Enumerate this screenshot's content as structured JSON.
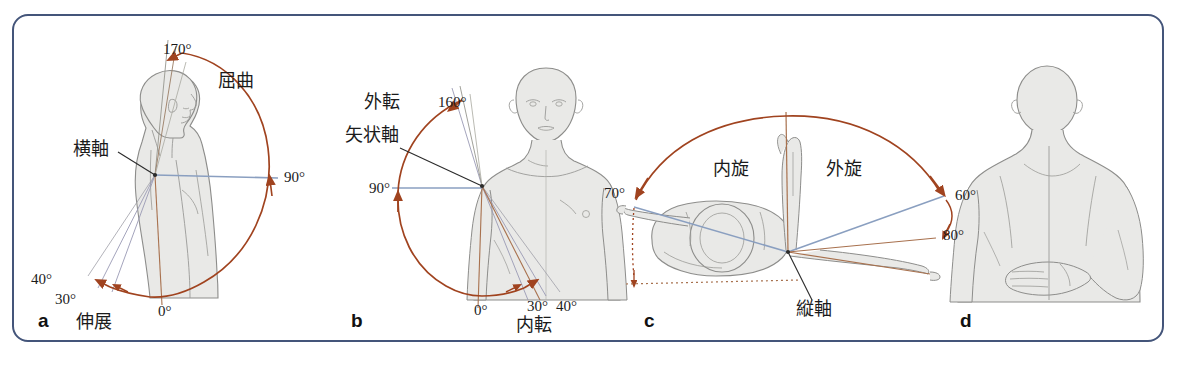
{
  "figure": {
    "border_color": "#44557a",
    "arc_color": "#a05030",
    "axis_line_color": "#8a9fc0",
    "body_fill": "#e9e9e7",
    "body_stroke": "#8d8d8b",
    "leader_color": "#2b2b2b"
  },
  "panels": [
    {
      "letter": "a",
      "name": "flexion-extension",
      "motion_label": "屈曲",
      "motion_label2": "伸展",
      "axis_label": "横軸",
      "angles": [
        "170°",
        "90°",
        "40°",
        "30°",
        "0°"
      ]
    },
    {
      "letter": "b",
      "name": "abduction-adduction",
      "motion_label": "外転",
      "motion_label2": "内転",
      "axis_label": "矢状軸",
      "angles": [
        "160°",
        "90°",
        "30°",
        "40°",
        "0°"
      ]
    },
    {
      "letter": "c",
      "name": "internal-external-rotation",
      "motion_label": "内旋",
      "motion_label2": "外旋",
      "axis_label": "縦軸",
      "angles": [
        "70°",
        "60°",
        "80°"
      ]
    },
    {
      "letter": "d",
      "name": "hand-behind-back-view",
      "motion_label": "",
      "motion_label2": "",
      "axis_label": "",
      "angles": []
    }
  ],
  "labels": {
    "a_170": "170°",
    "a_flexion": "屈曲",
    "a_transverse_axis": "横軸",
    "a_90": "90°",
    "a_40": "40°",
    "a_30": "30°",
    "a_0": "0°",
    "a_extension": "伸展",
    "a_letter": "a",
    "b_abduction": "外転",
    "b_sagittal_axis": "矢状軸",
    "b_160": "160°",
    "b_90": "90°",
    "b_0": "0°",
    "b_30": "30°",
    "b_40": "40°",
    "b_adduction": "内転",
    "b_letter": "b",
    "c_70": "70°",
    "c_internal_rotation": "内旋",
    "c_external_rotation": "外旋",
    "c_60": "60°",
    "c_80": "80°",
    "c_longitudinal_axis": "縦軸",
    "c_letter": "c",
    "d_letter": "d"
  }
}
